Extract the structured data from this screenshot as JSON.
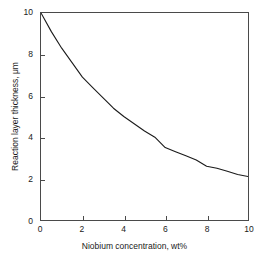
{
  "chart_data": {
    "type": "line",
    "title": "",
    "subtitle": "",
    "xlabel": "Niobium concentration, wt%",
    "ylabel": "Reaction layer thickness, μm",
    "xlim": [
      0,
      10
    ],
    "ylim": [
      0,
      10
    ],
    "xticks": [
      0,
      2,
      4,
      6,
      8,
      10
    ],
    "yticks": [
      0,
      2,
      4,
      6,
      8,
      10
    ],
    "xtick_labels": [
      "0",
      "2",
      "4",
      "6",
      "8",
      "10"
    ],
    "ytick_labels": [
      "0",
      "2",
      "4",
      "6",
      "8",
      "10"
    ],
    "grid": false,
    "legend": false,
    "legend_position": "none",
    "annotations": [],
    "series": [
      {
        "name": "Reaction layer thickness",
        "color": "#1a1a1a",
        "line_width": 1.1,
        "x": [
          0,
          0.5,
          1,
          1.5,
          2,
          2.5,
          3,
          3.5,
          4,
          4.5,
          5,
          5.5,
          6,
          6.5,
          7,
          7.5,
          8,
          8.5,
          9,
          9.5,
          10
        ],
        "y": [
          10.0,
          9.1,
          8.3,
          7.6,
          6.9,
          6.4,
          5.9,
          5.4,
          5.0,
          4.65,
          4.3,
          4.0,
          3.5,
          3.3,
          3.1,
          2.9,
          2.6,
          2.5,
          2.35,
          2.2,
          2.1
        ]
      }
    ]
  },
  "axes": {
    "frame_color": "#4a4a4a",
    "tick_color": "#4a4a4a",
    "text_color": "#1a1a1a"
  },
  "figure": {
    "background": "#ffffff"
  }
}
